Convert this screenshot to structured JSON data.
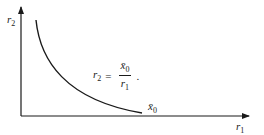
{
  "diagram": {
    "type": "indifference-curve",
    "axes": {
      "x_label": {
        "base": "r",
        "sub": "1"
      },
      "y_label": {
        "base": "r",
        "sub": "2"
      }
    },
    "curve": {
      "label": {
        "base": "x̄",
        "sub": "0"
      },
      "shape": "hyperbola"
    },
    "formula": {
      "lhs_base": "r",
      "lhs_sub": "2",
      "equals": "=",
      "num_base": "x̄",
      "num_sub": "0",
      "den_base": "r",
      "den_sub": "1",
      "trailing": "."
    },
    "colors": {
      "stroke": "#1a1a1a",
      "background": "#ffffff"
    }
  }
}
